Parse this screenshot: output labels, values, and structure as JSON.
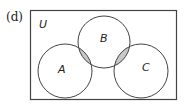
{
  "diagram": {
    "part_label": "(d)",
    "universe_label": "U",
    "sets": [
      {
        "name": "A",
        "cx": 65,
        "cy": 71,
        "r": 27
      },
      {
        "name": "B",
        "cx": 104,
        "cy": 42,
        "r": 26
      },
      {
        "name": "C",
        "cx": 141,
        "cy": 71,
        "r": 27
      }
    ],
    "shaded_regions": [
      "A ∩ B",
      "B ∩ C"
    ],
    "colors": {
      "stroke": "#444444",
      "shade": "#c8c8c8",
      "background": "#ffffff"
    }
  }
}
